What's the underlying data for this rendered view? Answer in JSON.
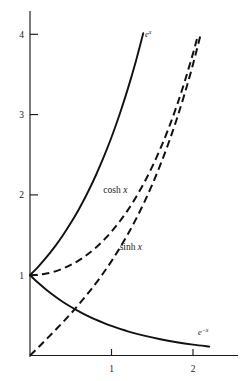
{
  "chart_data": {
    "type": "line",
    "title": "",
    "xlabel": "",
    "ylabel": "",
    "xlim": [
      -0.02,
      2.55
    ],
    "ylim": [
      -0.05,
      4.35
    ],
    "grid": false,
    "legend": "inline-curve-labels",
    "xticks": [
      1,
      2
    ],
    "xtick_labels": [
      "1",
      "2"
    ],
    "yticks": [
      1,
      2,
      3,
      4
    ],
    "ytick_labels": [
      "1",
      "2",
      "3",
      "4"
    ],
    "series": [
      {
        "name": "e^x",
        "label": "e",
        "label_sup": "x",
        "style": "solid",
        "label_x": 1.41,
        "label_y": 3.97,
        "x": [
          0,
          0.1,
          0.2,
          0.3,
          0.4,
          0.5,
          0.6,
          0.7,
          0.8,
          0.9,
          1.0,
          1.1,
          1.2,
          1.3,
          1.39
        ],
        "y": [
          1.0,
          1.105,
          1.221,
          1.35,
          1.492,
          1.649,
          1.822,
          2.014,
          2.226,
          2.46,
          2.718,
          3.004,
          3.32,
          3.669,
          4.015
        ]
      },
      {
        "name": "cosh x",
        "label": "cosh",
        "label_var": "x",
        "style": "dashed",
        "label_x": 0.9,
        "label_y": 2.02,
        "x": [
          0,
          0.1,
          0.2,
          0.3,
          0.4,
          0.5,
          0.6,
          0.7,
          0.8,
          0.9,
          1.0,
          1.1,
          1.2,
          1.3,
          1.4,
          1.5,
          1.6,
          1.7,
          1.8,
          1.9,
          2.0,
          2.05
        ],
        "y": [
          1.0,
          1.005,
          1.02,
          1.045,
          1.081,
          1.128,
          1.185,
          1.255,
          1.337,
          1.433,
          1.543,
          1.669,
          1.811,
          1.971,
          2.151,
          2.352,
          2.577,
          2.828,
          3.107,
          3.418,
          3.762,
          3.946
        ]
      },
      {
        "name": "sinh x",
        "label": "sinh",
        "label_var": "x",
        "style": "dashed",
        "label_x": 1.1,
        "label_y": 1.32,
        "x": [
          0,
          0.1,
          0.2,
          0.3,
          0.4,
          0.5,
          0.6,
          0.7,
          0.8,
          0.9,
          1.0,
          1.1,
          1.2,
          1.3,
          1.4,
          1.5,
          1.6,
          1.7,
          1.8,
          1.9,
          2.0,
          2.1
        ],
        "y": [
          0,
          0.1,
          0.201,
          0.305,
          0.411,
          0.521,
          0.637,
          0.759,
          0.888,
          1.027,
          1.175,
          1.336,
          1.509,
          1.698,
          1.904,
          2.129,
          2.376,
          2.646,
          2.942,
          3.268,
          3.627,
          4.022
        ]
      },
      {
        "name": "e^-x",
        "label": "e",
        "label_sup": "−x",
        "style": "solid",
        "label_x": 2.06,
        "label_y": 0.25,
        "x": [
          0,
          0.1,
          0.2,
          0.3,
          0.4,
          0.5,
          0.6,
          0.7,
          0.8,
          0.9,
          1.0,
          1.2,
          1.4,
          1.6,
          1.8,
          2.0,
          2.2
        ],
        "y": [
          1.0,
          0.905,
          0.819,
          0.741,
          0.67,
          0.607,
          0.549,
          0.497,
          0.449,
          0.407,
          0.368,
          0.301,
          0.247,
          0.202,
          0.165,
          0.135,
          0.111
        ]
      }
    ]
  },
  "axes": {
    "y_axis_name": "y-axis",
    "x_axis_name": "x-axis"
  }
}
